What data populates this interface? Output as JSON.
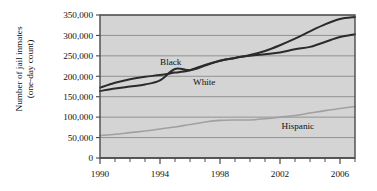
{
  "chart_data": {
    "type": "line",
    "title": "",
    "xlabel": "",
    "ylabel_line1": "Number of jail inmates",
    "ylabel_line2": "(one-day count)",
    "xlim": [
      1990,
      2007
    ],
    "ylim": [
      0,
      350000
    ],
    "grid": true,
    "legend_position": "inline-annotations",
    "plot_background": "#d4d4d4",
    "axis_color": "#4a4a4a",
    "gridline_color": "#8a8a8a",
    "xticks_major": [
      1990,
      1994,
      1998,
      2002,
      2006
    ],
    "xticks_major_labels": [
      "1990",
      "1994",
      "1998",
      "2002",
      "2006"
    ],
    "xticks_minor": [
      1991,
      1992,
      1993,
      1995,
      1996,
      1997,
      1999,
      2000,
      2001,
      2003,
      2004,
      2005,
      2007
    ],
    "yticks": [
      0,
      50000,
      100000,
      150000,
      200000,
      250000,
      300000,
      350000
    ],
    "ytick_labels": [
      "0",
      "50,000",
      "100,000",
      "150,000",
      "200,000",
      "250,000",
      "300,000",
      "350,000"
    ],
    "x": [
      1990,
      1991,
      1992,
      1993,
      1994,
      1995,
      1996,
      1997,
      1998,
      1999,
      2000,
      2001,
      2002,
      2003,
      2004,
      2005,
      2006,
      2007
    ],
    "series": [
      {
        "name": "Black",
        "label": "Black",
        "color": "#2b2b2b",
        "width": 2.0,
        "label_x": 1994.0,
        "label_y": 228000,
        "values": [
          172000,
          184000,
          193000,
          199000,
          203000,
          209000,
          215000,
          228000,
          238000,
          245000,
          252000,
          262000,
          276000,
          292000,
          310000,
          327000,
          340000,
          345000
        ]
      },
      {
        "name": "White",
        "label": "White",
        "color": "#2b2b2b",
        "width": 2.0,
        "label_x": 1996.2,
        "label_y": 178000,
        "values": [
          164000,
          170000,
          175000,
          180000,
          190000,
          218000,
          215000,
          226000,
          238000,
          245000,
          250000,
          254000,
          258000,
          266000,
          272000,
          284000,
          296000,
          303000
        ]
      },
      {
        "name": "Hispanic",
        "label": "Hispanic",
        "color": "#a0a0a0",
        "width": 1.6,
        "label_x": 2002.1,
        "label_y": 72000,
        "values": [
          55000,
          58000,
          62000,
          66000,
          71000,
          76000,
          82000,
          88000,
          92000,
          93000,
          93000,
          96000,
          100000,
          104000,
          110000,
          116000,
          121000,
          126000
        ]
      }
    ]
  }
}
